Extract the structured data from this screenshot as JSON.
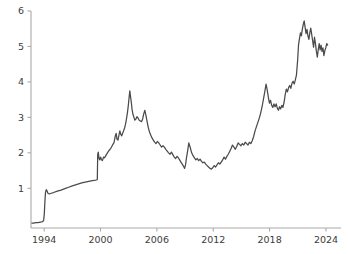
{
  "chart_data": {
    "type": "line",
    "title": "",
    "subtitle": "",
    "xlabel": "",
    "ylabel": "",
    "xlim": [
      1992.6,
      2025.6
    ],
    "ylim": [
      -0.12,
      6.0
    ],
    "grid": false,
    "legend": null,
    "line_color": "#4a4a4a",
    "axis_color": "#aaaaaa",
    "tick_text_color": "#3b3b3b",
    "xticks": [
      1994,
      2000,
      2006,
      2012,
      2018,
      2024
    ],
    "xtick_labels": [
      "1994",
      "2000",
      "2006",
      "2012",
      "2018",
      "2024"
    ],
    "yticks": [
      1,
      2,
      3,
      4,
      5,
      6
    ],
    "ytick_labels": [
      "1",
      "2",
      "3",
      "4",
      "5",
      "6"
    ],
    "series": [
      {
        "name": "value",
        "x": [
          1992.7,
          1992.9,
          1993.1,
          1993.3,
          1993.5,
          1993.7,
          1993.85,
          1993.95,
          1994.02,
          1994.08,
          1994.14,
          1994.22,
          1994.3,
          1994.4,
          1994.55,
          1994.75,
          1995.0,
          1995.4,
          1995.8,
          1996.2,
          1996.6,
          1997.0,
          1997.5,
          1998.0,
          1998.5,
          1999.0,
          1999.3,
          1999.5,
          1999.6,
          1999.66,
          1999.7,
          1999.76,
          1999.84,
          1999.92,
          2000.0,
          2000.1,
          2000.2,
          2000.32,
          2000.42,
          2000.52,
          2000.62,
          2000.72,
          2000.84,
          2000.95,
          2001.08,
          2001.2,
          2001.32,
          2001.44,
          2001.56,
          2001.66,
          2001.76,
          2001.86,
          2001.96,
          2002.06,
          2002.16,
          2002.26,
          2002.36,
          2002.46,
          2002.56,
          2002.66,
          2002.76,
          2002.86,
          2002.96,
          2003.04,
          2003.12,
          2003.2,
          2003.28,
          2003.36,
          2003.46,
          2003.56,
          2003.66,
          2003.76,
          2003.88,
          2004.0,
          2004.12,
          2004.24,
          2004.36,
          2004.48,
          2004.6,
          2004.72,
          2004.84,
          2004.96,
          2005.08,
          2005.2,
          2005.34,
          2005.48,
          2005.62,
          2005.76,
          2005.9,
          2006.05,
          2006.2,
          2006.35,
          2006.5,
          2006.65,
          2006.8,
          2006.95,
          2007.1,
          2007.25,
          2007.4,
          2007.55,
          2007.7,
          2007.85,
          2008.0,
          2008.14,
          2008.28,
          2008.42,
          2008.56,
          2008.7,
          2008.84,
          2008.95,
          2009.05,
          2009.15,
          2009.28,
          2009.4,
          2009.55,
          2009.7,
          2009.85,
          2010.0,
          2010.15,
          2010.3,
          2010.45,
          2010.6,
          2010.75,
          2010.9,
          2011.05,
          2011.2,
          2011.35,
          2011.5,
          2011.65,
          2011.8,
          2011.95,
          2012.1,
          2012.25,
          2012.4,
          2012.55,
          2012.7,
          2012.85,
          2013.0,
          2013.15,
          2013.3,
          2013.45,
          2013.6,
          2013.75,
          2013.9,
          2014.05,
          2014.2,
          2014.35,
          2014.5,
          2014.65,
          2014.8,
          2014.95,
          2015.1,
          2015.25,
          2015.4,
          2015.55,
          2015.7,
          2015.85,
          2016.0,
          2016.15,
          2016.3,
          2016.45,
          2016.6,
          2016.75,
          2016.9,
          2017.05,
          2017.2,
          2017.35,
          2017.5,
          2017.62,
          2017.74,
          2017.86,
          2017.98,
          2018.1,
          2018.22,
          2018.34,
          2018.46,
          2018.58,
          2018.7,
          2018.82,
          2018.94,
          2019.06,
          2019.18,
          2019.3,
          2019.42,
          2019.54,
          2019.66,
          2019.78,
          2019.9,
          2020.02,
          2020.14,
          2020.26,
          2020.38,
          2020.5,
          2020.62,
          2020.74,
          2020.86,
          2020.98,
          2021.08,
          2021.18,
          2021.28,
          2021.38,
          2021.48,
          2021.58,
          2021.68,
          2021.78,
          2021.88,
          2021.98,
          2022.08,
          2022.18,
          2022.28,
          2022.38,
          2022.48,
          2022.58,
          2022.68,
          2022.78,
          2022.88,
          2022.98,
          2023.08,
          2023.18,
          2023.28,
          2023.38,
          2023.48,
          2023.58,
          2023.68,
          2023.78,
          2023.88,
          2023.98,
          2024.08,
          2024.18
        ],
        "values": [
          0.02,
          0.02,
          0.03,
          0.03,
          0.04,
          0.05,
          0.06,
          0.1,
          0.3,
          0.62,
          0.88,
          0.96,
          0.93,
          0.86,
          0.84,
          0.86,
          0.88,
          0.92,
          0.95,
          0.99,
          1.03,
          1.07,
          1.11,
          1.15,
          1.18,
          1.21,
          1.22,
          1.23,
          1.24,
          1.25,
          1.95,
          2.02,
          1.84,
          1.8,
          1.88,
          1.81,
          1.78,
          1.88,
          1.86,
          1.9,
          1.95,
          1.99,
          2.04,
          2.08,
          2.12,
          2.18,
          2.24,
          2.29,
          2.46,
          2.55,
          2.38,
          2.36,
          2.5,
          2.62,
          2.52,
          2.48,
          2.55,
          2.62,
          2.7,
          2.8,
          2.95,
          3.12,
          3.34,
          3.55,
          3.75,
          3.58,
          3.42,
          3.22,
          3.08,
          3.0,
          2.92,
          2.95,
          3.02,
          2.98,
          2.92,
          2.9,
          2.88,
          2.95,
          3.1,
          3.2,
          3.05,
          2.88,
          2.72,
          2.6,
          2.5,
          2.42,
          2.36,
          2.3,
          2.26,
          2.32,
          2.28,
          2.22,
          2.16,
          2.2,
          2.16,
          2.1,
          2.05,
          2.0,
          1.96,
          2.02,
          1.95,
          1.88,
          1.84,
          1.9,
          1.86,
          1.8,
          1.74,
          1.68,
          1.62,
          1.56,
          1.66,
          1.86,
          2.06,
          2.28,
          2.15,
          2.0,
          1.92,
          1.86,
          1.8,
          1.84,
          1.78,
          1.82,
          1.76,
          1.72,
          1.74,
          1.68,
          1.64,
          1.6,
          1.56,
          1.54,
          1.58,
          1.64,
          1.6,
          1.66,
          1.72,
          1.68,
          1.74,
          1.8,
          1.88,
          1.82,
          1.9,
          1.96,
          2.04,
          2.12,
          2.22,
          2.16,
          2.1,
          2.18,
          2.28,
          2.24,
          2.2,
          2.26,
          2.22,
          2.3,
          2.26,
          2.22,
          2.3,
          2.26,
          2.34,
          2.46,
          2.62,
          2.74,
          2.86,
          2.98,
          3.12,
          3.3,
          3.52,
          3.74,
          3.94,
          3.78,
          3.58,
          3.4,
          3.48,
          3.34,
          3.28,
          3.38,
          3.3,
          3.38,
          3.26,
          3.2,
          3.3,
          3.24,
          3.34,
          3.28,
          3.42,
          3.64,
          3.8,
          3.72,
          3.84,
          3.9,
          3.82,
          3.96,
          4.02,
          3.94,
          4.06,
          4.2,
          4.6,
          5.05,
          5.22,
          5.38,
          5.3,
          5.48,
          5.62,
          5.72,
          5.54,
          5.36,
          5.48,
          5.3,
          5.2,
          5.38,
          5.52,
          5.34,
          5.16,
          4.98,
          5.26,
          5.08,
          4.86,
          4.7,
          4.92,
          5.08,
          4.9,
          5.04,
          4.86,
          4.96,
          4.74,
          4.88,
          4.96,
          5.08,
          5.04
        ]
      }
    ]
  },
  "axes": {
    "y_axis_name": "value-axis",
    "x_axis_name": "time-axis"
  }
}
